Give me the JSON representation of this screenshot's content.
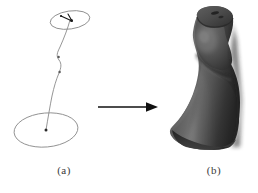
{
  "figure": {
    "background_color": "#ffffff",
    "panels": [
      {
        "id": "a",
        "caption": "(a)",
        "description": "wireframe generalized cylinder: spine curve with elliptical cross sections",
        "stroke_color": "#8a8a8a",
        "marker_color": "#1a1a1a"
      },
      {
        "id": "b",
        "caption": "(b)",
        "description": "rendered swept surface solid",
        "surface_color": "#4a4a4a",
        "shadow_color": "#242424",
        "highlight_color": "#6e6e6e"
      }
    ],
    "arrow": {
      "name": "transformation-arrow",
      "direction": "right",
      "color": "#111111"
    },
    "geometry": {
      "top_cross_section": {
        "center_x": 70,
        "center_y": 20,
        "rx": 20,
        "ry": 9,
        "rotation_deg": -8
      },
      "bottom_cross_section": {
        "center_x": 46,
        "center_y": 130,
        "rx": 32,
        "ry": 17,
        "rotation_deg": -5
      },
      "spine_points": [
        [
          70,
          20
        ],
        [
          67,
          34
        ],
        [
          62,
          47
        ],
        [
          58,
          56
        ],
        [
          61,
          64
        ],
        [
          59,
          73
        ],
        [
          55,
          82
        ],
        [
          52,
          96
        ],
        [
          49,
          112
        ],
        [
          46,
          130
        ]
      ],
      "spine_markers": [
        [
          59,
          56
        ],
        [
          60,
          72
        ],
        [
          70,
          20
        ],
        [
          46,
          130
        ]
      ]
    }
  }
}
